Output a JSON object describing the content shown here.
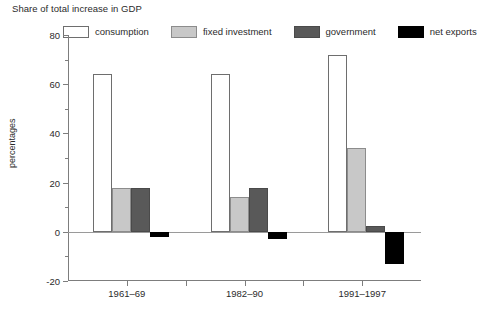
{
  "chart_data": {
    "type": "bar",
    "title": "Share of total increase in GDP",
    "xlabel": "",
    "ylabel": "percentages",
    "categories": [
      "1961–69",
      "1982–90",
      "1991–1997"
    ],
    "series": [
      {
        "name": "consumption",
        "values": [
          64,
          64,
          72
        ],
        "color": "#ffffff",
        "border": "#6e6e6e"
      },
      {
        "name": "fixed investment",
        "values": [
          18,
          14,
          34
        ],
        "color": "#c8c8c8",
        "border": "#8c8c8c"
      },
      {
        "name": "government",
        "values": [
          18,
          18,
          2.5
        ],
        "color": "#595959",
        "border": "#4a4a4a"
      },
      {
        "name": "net exports",
        "values": [
          -2,
          -3,
          -13
        ],
        "color": "#000000",
        "border": "#000000"
      }
    ],
    "ylim": [
      -20,
      80
    ],
    "yticks": [
      -20,
      0,
      20,
      40,
      60,
      80
    ],
    "ytick_labels": [
      "-20",
      "0",
      "20",
      "40",
      "60",
      "80"
    ],
    "yminor_ticks": [
      -10,
      10,
      30,
      50,
      70
    ],
    "grid": false,
    "legend_position": "top"
  },
  "legend": {
    "items": [
      {
        "label": "consumption"
      },
      {
        "label": "fixed investment"
      },
      {
        "label": "government"
      },
      {
        "label": "net exports"
      }
    ]
  }
}
